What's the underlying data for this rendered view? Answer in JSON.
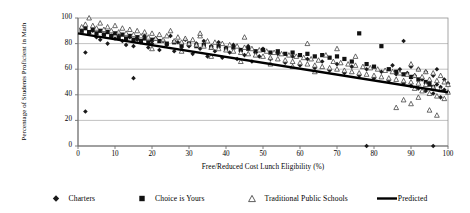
{
  "chart_data": {
    "type": "scatter",
    "title": "",
    "xlabel": "Free/Reduced Cost Lunch Eligibility (%)",
    "ylabel": "Percentage of Students Proficient in Math",
    "xlim": [
      0,
      100
    ],
    "ylim": [
      0,
      100
    ],
    "xticks": [
      0,
      10,
      20,
      30,
      40,
      50,
      60,
      70,
      80,
      90,
      100
    ],
    "yticks": [
      0,
      20,
      40,
      60,
      80,
      100
    ],
    "grid": "horizontal",
    "legend_position": "bottom",
    "legend": [
      {
        "name": "Charters",
        "marker": "diamond",
        "filled": true,
        "color": "#1a1a1a"
      },
      {
        "name": "Choice is Yours",
        "marker": "square",
        "filled": true,
        "color": "#111111"
      },
      {
        "name": "Traditional Public Schools",
        "marker": "triangle",
        "filled": false,
        "color": "#333333"
      },
      {
        "name": "Predicted",
        "marker": "line",
        "filled": true,
        "color": "#000000"
      }
    ],
    "series": [
      {
        "name": "Charters",
        "marker": "diamond",
        "points": [
          [
            2,
            27
          ],
          [
            2,
            73
          ],
          [
            3,
            88
          ],
          [
            4,
            90
          ],
          [
            5,
            85
          ],
          [
            6,
            83
          ],
          [
            7,
            87
          ],
          [
            8,
            80
          ],
          [
            9,
            86
          ],
          [
            10,
            84
          ],
          [
            11,
            88
          ],
          [
            12,
            82
          ],
          [
            13,
            79
          ],
          [
            14,
            85
          ],
          [
            15,
            53
          ],
          [
            15,
            78
          ],
          [
            16,
            83
          ],
          [
            17,
            81
          ],
          [
            18,
            86
          ],
          [
            19,
            77
          ],
          [
            20,
            80
          ],
          [
            21,
            84
          ],
          [
            22,
            75
          ],
          [
            23,
            82
          ],
          [
            24,
            79
          ],
          [
            25,
            86
          ],
          [
            26,
            74
          ],
          [
            27,
            81
          ],
          [
            28,
            77
          ],
          [
            29,
            83
          ],
          [
            30,
            78
          ],
          [
            31,
            72
          ],
          [
            32,
            80
          ],
          [
            33,
            76
          ],
          [
            34,
            82
          ],
          [
            35,
            70
          ],
          [
            36,
            78
          ],
          [
            37,
            74
          ],
          [
            38,
            81
          ],
          [
            39,
            69
          ],
          [
            40,
            77
          ],
          [
            41,
            73
          ],
          [
            42,
            79
          ],
          [
            43,
            68
          ],
          [
            44,
            75
          ],
          [
            45,
            71
          ],
          [
            46,
            78
          ],
          [
            47,
            66
          ],
          [
            48,
            73
          ],
          [
            49,
            70
          ],
          [
            50,
            76
          ],
          [
            52,
            68
          ],
          [
            54,
            72
          ],
          [
            56,
            65
          ],
          [
            58,
            70
          ],
          [
            60,
            63
          ],
          [
            62,
            68
          ],
          [
            64,
            61
          ],
          [
            66,
            66
          ],
          [
            68,
            59
          ],
          [
            70,
            64
          ],
          [
            72,
            57
          ],
          [
            74,
            62
          ],
          [
            76,
            55
          ],
          [
            78,
            0
          ],
          [
            78,
            60
          ],
          [
            80,
            53
          ],
          [
            82,
            58
          ],
          [
            84,
            51
          ],
          [
            85,
            63
          ],
          [
            86,
            56
          ],
          [
            87,
            60
          ],
          [
            88,
            82
          ],
          [
            88,
            49
          ],
          [
            89,
            57
          ],
          [
            90,
            62
          ],
          [
            90,
            47
          ],
          [
            91,
            55
          ],
          [
            92,
            60
          ],
          [
            92,
            45
          ],
          [
            93,
            52
          ],
          [
            94,
            58
          ],
          [
            94,
            43
          ],
          [
            95,
            50
          ],
          [
            96,
            0
          ],
          [
            96,
            55
          ],
          [
            96,
            41
          ],
          [
            97,
            48
          ],
          [
            97,
            60
          ],
          [
            98,
            46
          ],
          [
            98,
            38
          ],
          [
            99,
            52
          ],
          [
            99,
            44
          ],
          [
            100,
            49
          ],
          [
            100,
            42
          ]
        ]
      },
      {
        "name": "Choice is Yours",
        "marker": "square",
        "points": [
          [
            1,
            90
          ],
          [
            2,
            92
          ],
          [
            3,
            89
          ],
          [
            4,
            91
          ],
          [
            5,
            88
          ],
          [
            6,
            90
          ],
          [
            7,
            87
          ],
          [
            8,
            89
          ],
          [
            9,
            86
          ],
          [
            10,
            88
          ],
          [
            11,
            85
          ],
          [
            12,
            87
          ],
          [
            13,
            84
          ],
          [
            14,
            86
          ],
          [
            15,
            83
          ],
          [
            16,
            85
          ],
          [
            17,
            82
          ],
          [
            18,
            84
          ],
          [
            19,
            81
          ],
          [
            20,
            83
          ],
          [
            22,
            82
          ],
          [
            24,
            80
          ],
          [
            26,
            81
          ],
          [
            28,
            79
          ],
          [
            30,
            80
          ],
          [
            32,
            78
          ],
          [
            34,
            79
          ],
          [
            36,
            77
          ],
          [
            38,
            78
          ],
          [
            40,
            76
          ],
          [
            42,
            77
          ],
          [
            44,
            75
          ],
          [
            46,
            76
          ],
          [
            48,
            74
          ],
          [
            50,
            75
          ],
          [
            52,
            73
          ],
          [
            54,
            74
          ],
          [
            56,
            72
          ],
          [
            58,
            73
          ],
          [
            60,
            71
          ],
          [
            62,
            72
          ],
          [
            64,
            70
          ],
          [
            66,
            71
          ],
          [
            68,
            69
          ],
          [
            70,
            70
          ],
          [
            72,
            68
          ],
          [
            74,
            66
          ],
          [
            76,
            88
          ],
          [
            78,
            64
          ],
          [
            80,
            62
          ],
          [
            82,
            78
          ],
          [
            84,
            60
          ],
          [
            86,
            58
          ],
          [
            88,
            56
          ],
          [
            90,
            54
          ],
          [
            92,
            52
          ],
          [
            94,
            50
          ],
          [
            95,
            48
          ],
          [
            96,
            46
          ]
        ]
      },
      {
        "name": "Traditional Public Schools",
        "marker": "triangle",
        "points": [
          [
            1,
            93
          ],
          [
            2,
            95
          ],
          [
            3,
            100
          ],
          [
            4,
            94
          ],
          [
            5,
            92
          ],
          [
            6,
            96
          ],
          [
            7,
            91
          ],
          [
            8,
            93
          ],
          [
            9,
            90
          ],
          [
            10,
            94
          ],
          [
            11,
            89
          ],
          [
            12,
            92
          ],
          [
            13,
            88
          ],
          [
            14,
            91
          ],
          [
            15,
            87
          ],
          [
            16,
            90
          ],
          [
            17,
            86
          ],
          [
            18,
            89
          ],
          [
            19,
            85
          ],
          [
            20,
            88
          ],
          [
            21,
            84
          ],
          [
            22,
            87
          ],
          [
            23,
            83
          ],
          [
            24,
            86
          ],
          [
            25,
            90
          ],
          [
            26,
            82
          ],
          [
            27,
            85
          ],
          [
            28,
            81
          ],
          [
            29,
            84
          ],
          [
            30,
            80
          ],
          [
            31,
            83
          ],
          [
            32,
            79
          ],
          [
            33,
            86
          ],
          [
            34,
            78
          ],
          [
            35,
            82
          ],
          [
            36,
            77
          ],
          [
            37,
            81
          ],
          [
            38,
            76
          ],
          [
            39,
            80
          ],
          [
            40,
            75
          ],
          [
            41,
            79
          ],
          [
            42,
            74
          ],
          [
            43,
            78
          ],
          [
            44,
            73
          ],
          [
            45,
            77
          ],
          [
            46,
            72
          ],
          [
            47,
            76
          ],
          [
            48,
            71
          ],
          [
            49,
            75
          ],
          [
            50,
            70
          ],
          [
            51,
            74
          ],
          [
            52,
            69
          ],
          [
            53,
            73
          ],
          [
            54,
            68
          ],
          [
            55,
            72
          ],
          [
            56,
            67
          ],
          [
            57,
            71
          ],
          [
            58,
            66
          ],
          [
            59,
            70
          ],
          [
            60,
            65
          ],
          [
            61,
            69
          ],
          [
            62,
            64
          ],
          [
            63,
            68
          ],
          [
            64,
            63
          ],
          [
            65,
            67
          ],
          [
            66,
            62
          ],
          [
            67,
            71
          ],
          [
            68,
            61
          ],
          [
            69,
            66
          ],
          [
            70,
            60
          ],
          [
            71,
            65
          ],
          [
            72,
            59
          ],
          [
            73,
            64
          ],
          [
            74,
            58
          ],
          [
            75,
            63
          ],
          [
            76,
            57
          ],
          [
            77,
            62
          ],
          [
            78,
            56
          ],
          [
            79,
            61
          ],
          [
            80,
            55
          ],
          [
            81,
            60
          ],
          [
            82,
            54
          ],
          [
            83,
            59
          ],
          [
            84,
            53
          ],
          [
            85,
            58
          ],
          [
            86,
            52
          ],
          [
            87,
            57
          ],
          [
            88,
            51
          ],
          [
            89,
            56
          ],
          [
            90,
            50
          ],
          [
            90,
            64
          ],
          [
            91,
            55
          ],
          [
            91,
            45
          ],
          [
            92,
            60
          ],
          [
            92,
            49
          ],
          [
            93,
            54
          ],
          [
            93,
            43
          ],
          [
            94,
            58
          ],
          [
            94,
            48
          ],
          [
            95,
            52
          ],
          [
            95,
            41
          ],
          [
            96,
            57
          ],
          [
            96,
            46
          ],
          [
            97,
            51
          ],
          [
            97,
            39
          ],
          [
            98,
            55
          ],
          [
            98,
            44
          ],
          [
            99,
            50
          ],
          [
            99,
            37
          ],
          [
            100,
            48
          ],
          [
            100,
            42
          ],
          [
            33,
            88
          ],
          [
            45,
            85
          ],
          [
            62,
            80
          ],
          [
            70,
            76
          ],
          [
            75,
            70
          ],
          [
            86,
            30
          ],
          [
            90,
            33
          ],
          [
            95,
            28
          ],
          [
            97,
            24
          ],
          [
            88,
            36
          ],
          [
            92,
            38
          ],
          [
            44,
            66
          ],
          [
            52,
            64
          ],
          [
            58,
            62
          ],
          [
            64,
            58
          ],
          [
            36,
            70
          ],
          [
            28,
            74
          ],
          [
            20,
            76
          ]
        ]
      }
    ],
    "trendline": {
      "name": "Predicted",
      "x": [
        0,
        100
      ],
      "y": [
        88,
        42
      ]
    }
  }
}
